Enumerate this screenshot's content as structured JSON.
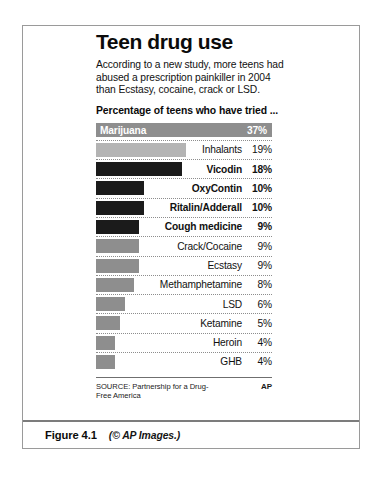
{
  "figure": {
    "caption_number": "Figure 4.1",
    "caption_credit": "(© AP Images.)"
  },
  "graphic": {
    "headline": "Teen drug use",
    "deck": "According to a new study, more teens had abused a prescription painkiller in 2004 than Ecstasy, cocaine, crack or LSD.",
    "chart_kicker": "Percentage of teens who have tried ...",
    "source": "SOURCE: Partnership for a Drug-Free America",
    "credit": "AP"
  },
  "chart_data": {
    "type": "bar",
    "title": "Teen drug use",
    "subtitle": "Percentage of teens who have tried ...",
    "xlabel": "",
    "ylabel": "",
    "xlim": [
      0,
      37
    ],
    "grid": false,
    "legend": "none",
    "orientation": "horizontal",
    "source": "SOURCE: Partnership for a Drug-Free America",
    "credit": "AP",
    "categories": [
      "Marijuana",
      "Inhalants",
      "Vicodin",
      "OxyContin",
      "Ritalin/Adderall",
      "Cough medicine",
      "Crack/Cocaine",
      "Ecstasy",
      "Methamphetamine",
      "LSD",
      "Ketamine",
      "Heroin",
      "GHB"
    ],
    "values": [
      37,
      19,
      18,
      10,
      10,
      9,
      9,
      9,
      8,
      6,
      5,
      4,
      4
    ],
    "value_labels": [
      "37%",
      "19%",
      "18%",
      "10%",
      "10%",
      "9%",
      "9%",
      "9%",
      "8%",
      "6%",
      "5%",
      "4%",
      "4%"
    ],
    "bars": [
      {
        "label": "Marijuana",
        "value": 37,
        "value_label": "37%",
        "color": "#8e8e8e",
        "shade": "mid",
        "label_inside": true,
        "label_bold": true
      },
      {
        "label": "Inhalants",
        "value": 19,
        "value_label": "19%",
        "color": "#b4b4b4",
        "shade": "light",
        "label_inside": false,
        "label_bold": false
      },
      {
        "label": "Vicodin",
        "value": 18,
        "value_label": "18%",
        "color": "#1b1b1b",
        "shade": "dark",
        "label_inside": false,
        "label_bold": true
      },
      {
        "label": "OxyContin",
        "value": 10,
        "value_label": "10%",
        "color": "#1b1b1b",
        "shade": "dark",
        "label_inside": false,
        "label_bold": true
      },
      {
        "label": "Ritalin/Adderall",
        "value": 10,
        "value_label": "10%",
        "color": "#1b1b1b",
        "shade": "dark",
        "label_inside": false,
        "label_bold": true
      },
      {
        "label": "Cough medicine",
        "value": 9,
        "value_label": "9%",
        "color": "#1b1b1b",
        "shade": "dark",
        "label_inside": false,
        "label_bold": true
      },
      {
        "label": "Crack/Cocaine",
        "value": 9,
        "value_label": "9%",
        "color": "#8e8e8e",
        "shade": "mid",
        "label_inside": false,
        "label_bold": false
      },
      {
        "label": "Ecstasy",
        "value": 9,
        "value_label": "9%",
        "color": "#8e8e8e",
        "shade": "mid",
        "label_inside": false,
        "label_bold": false
      },
      {
        "label": "Methamphetamine",
        "value": 8,
        "value_label": "8%",
        "color": "#8e8e8e",
        "shade": "mid",
        "label_inside": false,
        "label_bold": false
      },
      {
        "label": "LSD",
        "value": 6,
        "value_label": "6%",
        "color": "#8e8e8e",
        "shade": "mid",
        "label_inside": false,
        "label_bold": false
      },
      {
        "label": "Ketamine",
        "value": 5,
        "value_label": "5%",
        "color": "#8e8e8e",
        "shade": "mid",
        "label_inside": false,
        "label_bold": false
      },
      {
        "label": "Heroin",
        "value": 4,
        "value_label": "4%",
        "color": "#8e8e8e",
        "shade": "mid",
        "label_inside": false,
        "label_bold": false
      },
      {
        "label": "GHB",
        "value": 4,
        "value_label": "4%",
        "color": "#8e8e8e",
        "shade": "mid",
        "label_inside": false,
        "label_bold": false
      }
    ]
  }
}
